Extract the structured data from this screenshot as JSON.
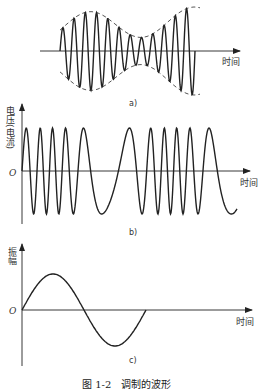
{
  "figure": {
    "caption": "图 1-2　调制的波形",
    "panels": [
      {
        "id": "a",
        "sublabel": "a)",
        "x_axis_label": "时间",
        "description": "Amplitude-modulated carrier with dashed envelope"
      },
      {
        "id": "b",
        "sublabel": "b)",
        "x_axis_label": "时间",
        "y_axis_label": "电压(电流)",
        "origin_label": "O",
        "description": "Frequency-modulated wave"
      },
      {
        "id": "c",
        "sublabel": "c)",
        "x_axis_label": "时间",
        "y_axis_label": "振幅",
        "origin_label": "O",
        "description": "Modulating signal (one sine period)"
      }
    ]
  },
  "colors": {
    "line": "#222222",
    "dashed": "#444444",
    "text": "#333333",
    "background": "#ffffff"
  }
}
